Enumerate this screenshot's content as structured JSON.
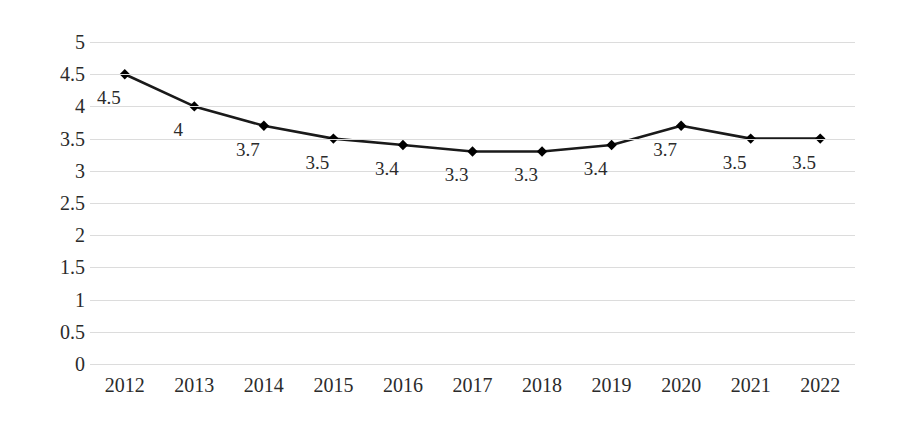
{
  "chart_data": {
    "type": "line",
    "title": "",
    "subtitle": "",
    "xlabel": "",
    "ylabel": "",
    "categories": [
      "2012",
      "2013",
      "2014",
      "2015",
      "2016",
      "2017",
      "2018",
      "2019",
      "2020",
      "2021",
      "2022"
    ],
    "values": [
      4.5,
      4,
      3.7,
      3.5,
      3.4,
      3.3,
      3.3,
      3.4,
      3.7,
      3.5,
      3.5
    ],
    "point_labels": [
      "4.5",
      "4",
      "3.7",
      "3.5",
      "3.4",
      "3.3",
      "3.3",
      "3.4",
      "3.7",
      "3.5",
      "3.5"
    ],
    "ylim": [
      0,
      5
    ],
    "ytick_values": [
      5,
      4.5,
      4,
      3.5,
      3,
      2.5,
      2,
      1.5,
      1,
      0.5,
      0
    ],
    "ytick_labels": [
      "5",
      "4.5",
      "4",
      "3.5",
      "3",
      "2.5",
      "2",
      "1.5",
      "1",
      "0.5",
      "0"
    ],
    "grid": true,
    "grid_axis": "y",
    "legend": false,
    "legend_position": "none",
    "marker": "diamond",
    "series": [
      {
        "name": "",
        "values": [
          4.5,
          4,
          3.7,
          3.5,
          3.4,
          3.3,
          3.3,
          3.4,
          3.7,
          3.5,
          3.5
        ]
      }
    ],
    "colors": {
      "line": "#1a1a1a",
      "marker": "#000000",
      "gridline": "#dcdcdc",
      "background": "#ffffff",
      "text": "#2b2b2b"
    }
  }
}
